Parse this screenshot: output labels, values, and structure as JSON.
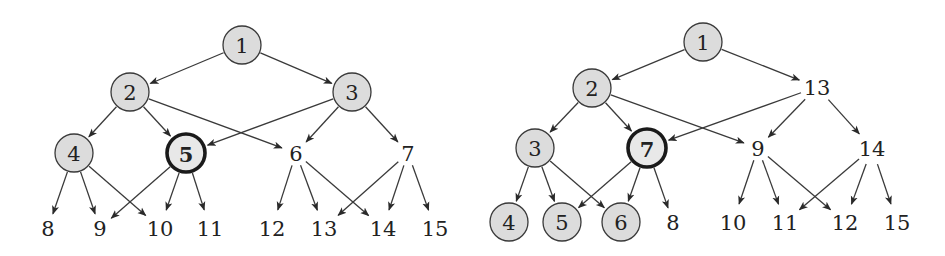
{
  "diagram": {
    "type": "directed-graph",
    "colors": {
      "shaded_fill": "#dcdcdc",
      "stroke": "#3a3a3a",
      "background": "#ffffff"
    },
    "graphs": [
      {
        "id": "left",
        "nodes": [
          {
            "id": "L1",
            "label": "1",
            "x": 242,
            "y": 45,
            "style": "shaded"
          },
          {
            "id": "L2",
            "label": "2",
            "x": 130,
            "y": 92,
            "style": "shaded"
          },
          {
            "id": "L3",
            "label": "3",
            "x": 352,
            "y": 92,
            "style": "shaded"
          },
          {
            "id": "L4",
            "label": "4",
            "x": 74,
            "y": 153,
            "style": "shaded"
          },
          {
            "id": "L5",
            "label": "5",
            "x": 186,
            "y": 153,
            "style": "bold"
          },
          {
            "id": "L6",
            "label": "6",
            "x": 296,
            "y": 153,
            "style": "plain"
          },
          {
            "id": "L7",
            "label": "7",
            "x": 408,
            "y": 153,
            "style": "plain"
          },
          {
            "id": "L8",
            "label": "8",
            "x": 48,
            "y": 228,
            "style": "plain"
          },
          {
            "id": "L9",
            "label": "9",
            "x": 100,
            "y": 228,
            "style": "plain"
          },
          {
            "id": "L10",
            "label": "10",
            "x": 160,
            "y": 228,
            "style": "plain"
          },
          {
            "id": "L11",
            "label": "11",
            "x": 210,
            "y": 228,
            "style": "plain"
          },
          {
            "id": "L12",
            "label": "12",
            "x": 272,
            "y": 228,
            "style": "plain"
          },
          {
            "id": "L13",
            "label": "13",
            "x": 324,
            "y": 228,
            "style": "plain"
          },
          {
            "id": "L14",
            "label": "14",
            "x": 383,
            "y": 228,
            "style": "plain"
          },
          {
            "id": "L15",
            "label": "15",
            "x": 435,
            "y": 228,
            "style": "plain"
          }
        ],
        "edges": [
          [
            "L1",
            "L2"
          ],
          [
            "L1",
            "L3"
          ],
          [
            "L2",
            "L4"
          ],
          [
            "L2",
            "L5"
          ],
          [
            "L2",
            "L6"
          ],
          [
            "L3",
            "L5"
          ],
          [
            "L3",
            "L6"
          ],
          [
            "L3",
            "L7"
          ],
          [
            "L4",
            "L8"
          ],
          [
            "L4",
            "L9"
          ],
          [
            "L4",
            "L10"
          ],
          [
            "L5",
            "L9"
          ],
          [
            "L5",
            "L10"
          ],
          [
            "L5",
            "L11"
          ],
          [
            "L6",
            "L12"
          ],
          [
            "L6",
            "L13"
          ],
          [
            "L6",
            "L14"
          ],
          [
            "L7",
            "L13"
          ],
          [
            "L7",
            "L14"
          ],
          [
            "L7",
            "L15"
          ]
        ]
      },
      {
        "id": "right",
        "nodes": [
          {
            "id": "R1",
            "label": "1",
            "x": 703,
            "y": 42,
            "style": "shaded"
          },
          {
            "id": "R2",
            "label": "2",
            "x": 592,
            "y": 88,
            "style": "shaded"
          },
          {
            "id": "R13",
            "label": "13",
            "x": 817,
            "y": 87,
            "style": "plain"
          },
          {
            "id": "R3",
            "label": "3",
            "x": 535,
            "y": 148,
            "style": "shaded"
          },
          {
            "id": "R7",
            "label": "7",
            "x": 647,
            "y": 148,
            "style": "bold"
          },
          {
            "id": "R9",
            "label": "9",
            "x": 758,
            "y": 148,
            "style": "plain"
          },
          {
            "id": "R14",
            "label": "14",
            "x": 872,
            "y": 148,
            "style": "plain"
          },
          {
            "id": "R4",
            "label": "4",
            "x": 509,
            "y": 222,
            "style": "shaded"
          },
          {
            "id": "R5",
            "label": "5",
            "x": 562,
            "y": 222,
            "style": "shaded"
          },
          {
            "id": "R6",
            "label": "6",
            "x": 621,
            "y": 222,
            "style": "shaded"
          },
          {
            "id": "R8",
            "label": "8",
            "x": 673,
            "y": 222,
            "style": "plain"
          },
          {
            "id": "R10",
            "label": "10",
            "x": 733,
            "y": 222,
            "style": "plain"
          },
          {
            "id": "R11",
            "label": "11",
            "x": 785,
            "y": 222,
            "style": "plain"
          },
          {
            "id": "R12",
            "label": "12",
            "x": 845,
            "y": 222,
            "style": "plain"
          },
          {
            "id": "R15",
            "label": "15",
            "x": 897,
            "y": 222,
            "style": "plain"
          }
        ],
        "edges": [
          [
            "R1",
            "R2"
          ],
          [
            "R1",
            "R13"
          ],
          [
            "R2",
            "R3"
          ],
          [
            "R2",
            "R7"
          ],
          [
            "R2",
            "R9"
          ],
          [
            "R13",
            "R7"
          ],
          [
            "R13",
            "R9"
          ],
          [
            "R13",
            "R14"
          ],
          [
            "R3",
            "R4"
          ],
          [
            "R3",
            "R5"
          ],
          [
            "R3",
            "R6"
          ],
          [
            "R7",
            "R5"
          ],
          [
            "R7",
            "R6"
          ],
          [
            "R7",
            "R8"
          ],
          [
            "R9",
            "R10"
          ],
          [
            "R9",
            "R11"
          ],
          [
            "R9",
            "R12"
          ],
          [
            "R14",
            "R11"
          ],
          [
            "R14",
            "R12"
          ],
          [
            "R14",
            "R15"
          ]
        ]
      }
    ]
  }
}
